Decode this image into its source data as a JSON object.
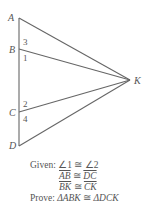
{
  "diagram": {
    "vertices": {
      "A": {
        "label": "A",
        "x": 19,
        "y": 18
      },
      "B": {
        "label": "B",
        "x": 19,
        "y": 49
      },
      "C": {
        "label": "C",
        "x": 19,
        "y": 112
      },
      "D": {
        "label": "D",
        "x": 19,
        "y": 146
      },
      "K": {
        "label": "K",
        "x": 130,
        "y": 80
      }
    },
    "segments": [
      [
        "A",
        "D"
      ],
      [
        "A",
        "K"
      ],
      [
        "B",
        "K"
      ],
      [
        "C",
        "K"
      ],
      [
        "D",
        "K"
      ]
    ],
    "angle_labels": {
      "a3": "3",
      "a1": "1",
      "a2": "2",
      "a4": "4"
    },
    "line_color": "#666666"
  },
  "statements": {
    "given_label": "Given:",
    "given_1_left": "∠1",
    "given_1_rel": "≅",
    "given_1_right": "∠2",
    "given_2_left": "AB",
    "given_2_rel": "≅",
    "given_2_right": "DC",
    "given_3_left": "BK",
    "given_3_rel": "≅",
    "given_3_right": "CK",
    "prove_label": "Prove:",
    "prove_left": "ΔABK",
    "prove_rel": "≅",
    "prove_right": "ΔDCK"
  }
}
